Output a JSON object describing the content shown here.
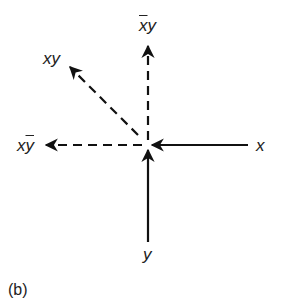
{
  "diagram": {
    "caption": "(b)",
    "center": {
      "x": 148,
      "y": 145
    },
    "stroke_color": "#111111",
    "labels": {
      "x": "x",
      "y": "y",
      "xbar_y": {
        "bar": "x",
        "rest": "y"
      },
      "x_ybar": {
        "plain": "x",
        "bar": "y"
      },
      "xy": "xy"
    },
    "arrows": [
      {
        "name": "x-input-arrow",
        "style": "solid",
        "from": "x",
        "direction": "into-center"
      },
      {
        "name": "y-input-arrow",
        "style": "solid",
        "from": "y",
        "direction": "into-center"
      },
      {
        "name": "xbar-y-output-arrow",
        "style": "dashed",
        "to": "x̄y",
        "direction": "up"
      },
      {
        "name": "x-ybar-output-arrow",
        "style": "dashed",
        "to": "xȳ",
        "direction": "left"
      },
      {
        "name": "xy-output-arrow",
        "style": "dashed",
        "to": "xy",
        "direction": "up-left"
      }
    ]
  }
}
